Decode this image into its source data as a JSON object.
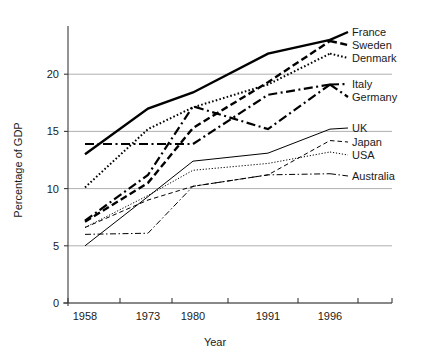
{
  "chart_data": {
    "type": "line",
    "title": "",
    "xlabel": "Year",
    "ylabel": "Percentage of GDP",
    "categories": [
      "1958",
      "1973",
      "1980",
      "1991",
      "1996"
    ],
    "x": [
      1958,
      1973,
      1980,
      1991,
      1996
    ],
    "ylim": [
      0,
      23.5
    ],
    "yticks": [
      0,
      5,
      10,
      15,
      20
    ],
    "ytick_labels": [
      "0",
      "5",
      "10",
      "15",
      "20"
    ],
    "grid": "horizontal",
    "legend_position": "right",
    "series": [
      {
        "name": "France",
        "values": [
          13.0,
          17.0,
          18.4,
          21.8,
          23.0
        ],
        "style": "solid",
        "width": 2.4
      },
      {
        "name": "Sweden",
        "values": [
          7.1,
          10.5,
          15.3,
          19.3,
          22.9
        ],
        "style": "dashed",
        "width": 2.4
      },
      {
        "name": "Denmark",
        "values": [
          10.1,
          15.2,
          17.1,
          19.1,
          21.8
        ],
        "style": "dotted",
        "width": 2.0
      },
      {
        "name": "Italy",
        "values": [
          13.9,
          13.9,
          13.9,
          18.2,
          19.1
        ],
        "style": "dashdot",
        "width": 2.2
      },
      {
        "name": "Germany",
        "values": [
          7.2,
          11.2,
          17.2,
          15.2,
          19.1
        ],
        "style": "dashdot",
        "width": 2.2
      },
      {
        "name": "UK",
        "values": [
          5.0,
          9.3,
          12.4,
          13.1,
          15.2
        ],
        "style": "solid",
        "width": 1.0
      },
      {
        "name": "Japan",
        "values": [
          6.6,
          9.0,
          10.2,
          11.2,
          14.2
        ],
        "style": "dashed",
        "width": 1.0
      },
      {
        "name": "USA",
        "values": [
          6.6,
          9.4,
          11.6,
          12.2,
          13.2
        ],
        "style": "dotted",
        "width": 1.0
      },
      {
        "name": "Australia",
        "values": [
          6.0,
          6.1,
          10.2,
          11.2,
          11.3
        ],
        "style": "dashdot",
        "width": 1.0
      }
    ],
    "legend_entries": [
      {
        "label": "France"
      },
      {
        "label": "Sweden"
      },
      {
        "label": "Denmark"
      },
      {
        "label": "Italy"
      },
      {
        "label": "Germany"
      },
      {
        "label": "UK"
      },
      {
        "label": "Japan"
      },
      {
        "label": "USA"
      },
      {
        "label": "Australia"
      }
    ]
  },
  "legend": {
    "france": "France",
    "sweden": "Sweden",
    "denmark": "Denmark",
    "italy": "Italy",
    "germany": "Germany",
    "uk": "UK",
    "japan": "Japan",
    "usa": "USA",
    "australia": "Australia"
  },
  "axes": {
    "y_title": "Percentage of GDP",
    "x_title": "Year",
    "y_ticks": [
      "0",
      "5",
      "10",
      "15",
      "20"
    ],
    "x_ticks": [
      "1958",
      "1973",
      "1980",
      "1991",
      "1996"
    ]
  },
  "colors": {
    "ink": "#000000",
    "grid": "#9a9a9a",
    "axis": "#3a3a3a",
    "background": "#ffffff"
  }
}
